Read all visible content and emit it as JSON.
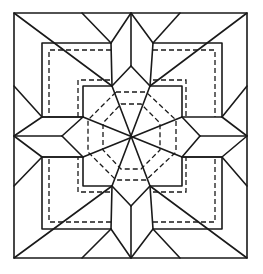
{
  "figure": {
    "title": "",
    "colors": {
      "line": "#1a1a1a",
      "background": "#ffffff"
    }
  }
}
